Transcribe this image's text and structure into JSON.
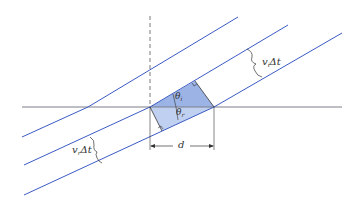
{
  "figure": {
    "colors": {
      "wavefront": "#3b5bc4",
      "boundary": "#7a7f8a",
      "normal": "#555555",
      "shaded_incident": "#8aa6e0",
      "shaded_refracted": "#b9cbee",
      "text": "#333333"
    },
    "labels": {
      "incident_distance": {
        "v": "v",
        "sub": "i",
        "rest": "Δt"
      },
      "refracted_distance": {
        "v": "v",
        "sub": "r",
        "rest": "Δt"
      },
      "theta_incident": {
        "v": "θ",
        "sub": "i"
      },
      "theta_refracted": {
        "v": "θ",
        "sub": "r"
      },
      "spacing": "d"
    }
  }
}
